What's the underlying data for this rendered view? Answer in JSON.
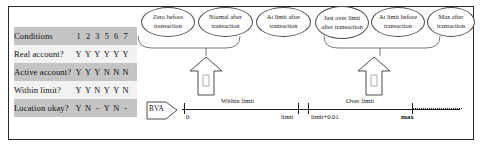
{
  "condition_table": {
    "header": {
      "label": "Conditions",
      "columns": [
        "1",
        "2",
        "3",
        "5",
        "6",
        "7"
      ]
    },
    "rows": [
      {
        "label": "Real account?",
        "values": [
          "Y",
          "Y",
          "Y",
          "Y",
          "Y",
          "Y"
        ]
      },
      {
        "label": "Active account?",
        "values": [
          "Y",
          "Y",
          "Y",
          "N",
          "N",
          "N"
        ]
      },
      {
        "label": "Within limit?",
        "values": [
          "Y",
          "Y",
          "N",
          "Y",
          "Y",
          "N"
        ]
      },
      {
        "label": "Location okay?",
        "values": [
          "Y",
          "N",
          "-",
          "Y",
          "N",
          "-"
        ]
      }
    ]
  },
  "callouts": [
    {
      "id": "zero-before",
      "text": "Zero before transaction"
    },
    {
      "id": "normal-after",
      "text": "Normal after transaction"
    },
    {
      "id": "at-limit-after",
      "text": "At limit after transaction"
    },
    {
      "id": "just-over-limit",
      "text": "Just over limit after transaction"
    },
    {
      "id": "at-limit-before",
      "text": "At limit before transaction"
    },
    {
      "id": "max-after",
      "text": "Max after transaction"
    }
  ],
  "bva": {
    "label": "BVA"
  },
  "number_line": {
    "bands": [
      {
        "id": "within-limit",
        "label": "Within limit"
      },
      {
        "id": "over-limit",
        "label": "Over limit"
      }
    ],
    "ticks": [
      {
        "id": "zero",
        "label": "0"
      },
      {
        "id": "limit",
        "label": "limit"
      },
      {
        "id": "limit-plus",
        "label": "limit+0.01"
      },
      {
        "id": "max",
        "label": "max"
      }
    ]
  },
  "colors": {
    "line": "#1d1d1d",
    "shaded_row": "#c4c4c4",
    "plain_row": "#f2f2f2",
    "frame": "#2a2a2a"
  }
}
